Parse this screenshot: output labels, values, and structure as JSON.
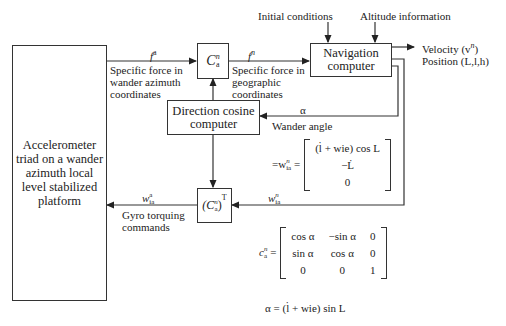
{
  "blocks": {
    "accelerometer": "Accelerometer triad on a wander azimuth local level stabilized platform",
    "c_a_n": "C",
    "c_a_n_sup": "n",
    "c_a_n_sub": "a",
    "navigation_computer": "Navigation computer",
    "direction_cosine_computer": "Direction cosine computer",
    "transpose": "(C",
    "transpose_tail": ")",
    "transpose_sup": "T"
  },
  "inputs": {
    "initial_conditions": "Initial conditions",
    "altitude_information": "Altitude information"
  },
  "outputs": {
    "velocity": "Velocity (v",
    "velocity_sup": "n",
    "velocity_tail": ")",
    "position": "Position (L,l,h)"
  },
  "signals": {
    "f_a": "f",
    "f_a_sup": "a",
    "f_a_desc": "Specific force in wander azimuth coordinates",
    "f_n": "f",
    "f_n_sup": "n",
    "f_n_desc": "Specific force in geographic coordinates",
    "alpha": "α",
    "alpha_desc": "Wander angle",
    "w_ia_n": "w",
    "w_ia_n_sup": "n",
    "w_ia_n_sub": "ia",
    "w_ia_a": "w",
    "w_ia_a_sup": "a",
    "w_ia_a_sub": "ia",
    "gyro_desc": "Gyro torquing commands"
  },
  "equations": {
    "w_eq_lhs": "=w",
    "w_eq_sup": "n",
    "w_eq_sub": "ia",
    "w_matrix": [
      "(l̇ + wie) cos L",
      "−L̇",
      "0"
    ],
    "c_lhs": "c",
    "c_sup": "n",
    "c_sub": "a",
    "c_matrix": [
      [
        "cos α",
        "−sin α",
        "0"
      ],
      [
        "sin α",
        "cos α",
        "0"
      ],
      [
        "0",
        "0",
        "1"
      ]
    ],
    "alpha_eq": "α = (l̇ + wie) sin L"
  }
}
